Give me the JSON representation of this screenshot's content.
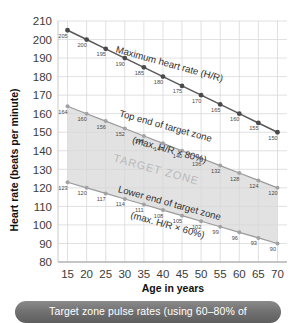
{
  "figure": {
    "caption": "Target zone pulse rates (using 60–80% of"
  },
  "axes": {
    "x_title": "Age in years",
    "y_title": "Heart rate (beats per minute)",
    "x_ticks": [
      "15",
      "20",
      "25",
      "30",
      "35",
      "40",
      "45",
      "50",
      "55",
      "60",
      "65",
      "70"
    ],
    "y_ticks": [
      "210",
      "200",
      "190",
      "180",
      "170",
      "160",
      "150",
      "140",
      "130",
      "120",
      "110",
      "100",
      "90",
      "80"
    ]
  },
  "annotations": {
    "max_hr": "Maximum heart rate (H/R)",
    "top_zone_line1": "Top end of target zone",
    "top_zone_line2": "(max. H/R × 80%)",
    "lower_zone_line1": "Lower end of target zone",
    "lower_zone_line2": "(max. H/R × 60%)",
    "zone_fill": "TARGET ZONE"
  },
  "colors": {
    "max_line": "#59595b",
    "max_marker": "#4a4a4c",
    "zone_line": "#9a9a9c",
    "zone_marker": "#a2a2a4",
    "zone_fill": "#d7d7d7",
    "grid": "#d8d8d8",
    "caption_bar": "#6e6e6e",
    "text": "#3b3b3b"
  },
  "chart_data": {
    "type": "line",
    "title": "Target zone pulse rates (using 60–80% of",
    "xlabel": "Age in years",
    "ylabel": "Heart rate (beats per minute)",
    "xlim": [
      12.5,
      72.5
    ],
    "ylim": [
      80,
      210
    ],
    "grid": true,
    "legend": "inline-annotations",
    "x": [
      15,
      20,
      25,
      30,
      35,
      40,
      45,
      50,
      55,
      60,
      65,
      70
    ],
    "series": [
      {
        "name": "Maximum heart rate (H/R)",
        "values": [
          205,
          200,
          195,
          190,
          185,
          180,
          175,
          170,
          165,
          160,
          155,
          150
        ]
      },
      {
        "name": "Top end of target zone (max. H/R × 80%)",
        "values": [
          164,
          160,
          156,
          152,
          148,
          144,
          140,
          136,
          132,
          128,
          124,
          120
        ]
      },
      {
        "name": "Lower end of target zone (max. H/R × 60%)",
        "values": [
          123,
          120,
          117,
          114,
          111,
          108,
          105,
          102,
          99,
          96,
          93,
          90
        ]
      }
    ],
    "shaded_region": {
      "label": "TARGET ZONE",
      "between": [
        "Top end of target zone (max. H/R × 80%)",
        "Lower end of target zone (max. H/R × 60%)"
      ]
    }
  }
}
